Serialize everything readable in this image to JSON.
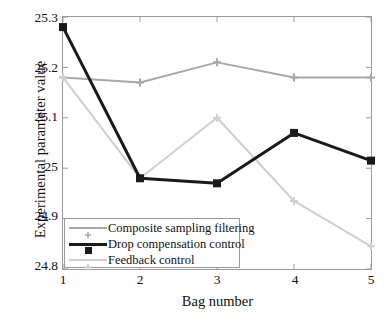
{
  "chart_data": {
    "type": "line",
    "title": "",
    "xlabel": "Bag number",
    "ylabel": "Experimental parameter value",
    "x": [
      1,
      2,
      3,
      4,
      5
    ],
    "categories": [
      "1",
      "2",
      "3",
      "4",
      "5"
    ],
    "xtick_labels": [
      "1",
      "2",
      "3",
      "4",
      "5"
    ],
    "ytick_labels": [
      "25.3",
      "25.2",
      "25.1",
      "25",
      "24.9",
      "24.8"
    ],
    "ytick_values": [
      25.3,
      25.2,
      25.1,
      25.0,
      24.9,
      24.8
    ],
    "xlim": [
      1,
      5
    ],
    "ylim": [
      24.8,
      25.3
    ],
    "grid": false,
    "legend_position": "lower left",
    "series": [
      {
        "name": "Composite sampling filtering",
        "values": [
          25.18,
          25.17,
          25.21,
          25.18,
          25.18
        ],
        "color": "#a8a8a8",
        "marker": "cross",
        "line_width": 2
      },
      {
        "name": "Drop compensation control",
        "values": [
          25.28,
          24.98,
          24.97,
          25.07,
          25.015
        ],
        "color": "#1a1a1a",
        "marker": "square",
        "line_width": 3
      },
      {
        "name": "Feedback control",
        "values": [
          25.18,
          24.98,
          25.1,
          24.935,
          24.845
        ],
        "color": "#cfcfcf",
        "marker": "cross",
        "line_width": 2
      }
    ]
  },
  "axis": {
    "y_title": "Experimental parameter value",
    "x_title": "Bag number",
    "y_ticks": [
      {
        "label": "25.3"
      },
      {
        "label": "25.2"
      },
      {
        "label": "25.1"
      },
      {
        "label": "25"
      },
      {
        "label": "24.9"
      },
      {
        "label": "24.8"
      }
    ],
    "x_ticks": [
      {
        "label": "1"
      },
      {
        "label": "2"
      },
      {
        "label": "3"
      },
      {
        "label": "4"
      },
      {
        "label": "5"
      }
    ]
  },
  "legend": {
    "entries": [
      {
        "label": "Composite sampling filtering"
      },
      {
        "label": "Drop compensation control"
      },
      {
        "label": "Feedback control"
      }
    ]
  }
}
